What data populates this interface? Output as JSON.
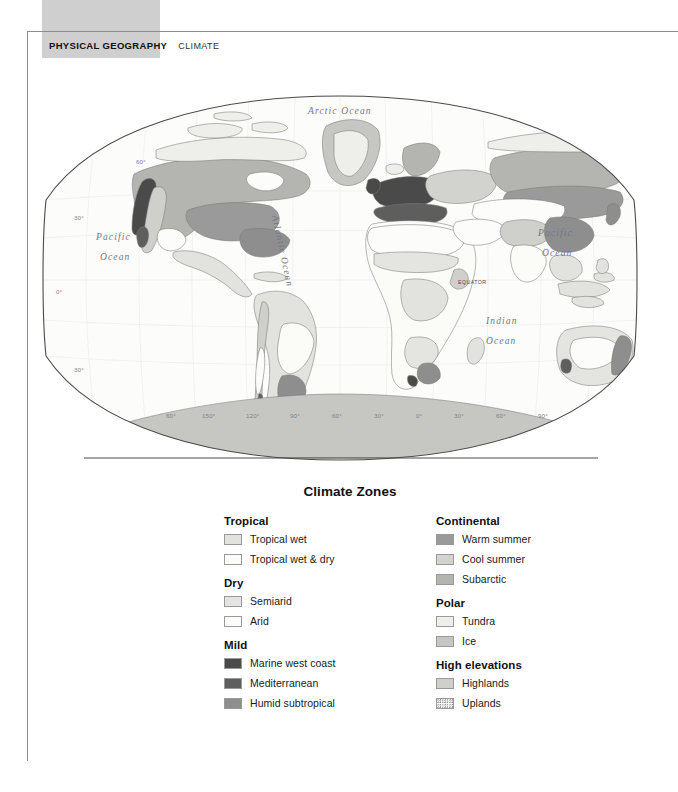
{
  "running_head": {
    "main": "PHYSICAL GEOGRAPHY",
    "sub": "CLIMATE"
  },
  "map": {
    "projection": "Robinson-style oval world map",
    "ocean_labels": [
      {
        "text": "Arctic  Ocean",
        "x": 298,
        "y": 22,
        "size": 9.5,
        "rotate": 0
      },
      {
        "text": "Pacific",
        "x": 70,
        "y": 148,
        "size": 9.5,
        "rotate": 0
      },
      {
        "text": "Ocean",
        "x": 72,
        "y": 168,
        "size": 9.5,
        "rotate": 0
      },
      {
        "text": "Pacific",
        "x": 512,
        "y": 145,
        "size": 9.5,
        "rotate": 0
      },
      {
        "text": "Ocean",
        "x": 514,
        "y": 165,
        "size": 9.5,
        "rotate": 0
      },
      {
        "text": "Indian",
        "x": 456,
        "y": 232,
        "size": 9.5,
        "rotate": 0
      },
      {
        "text": "Ocean",
        "x": 456,
        "y": 252,
        "size": 9.5,
        "rotate": 0
      }
    ],
    "rotated_ocean_label": {
      "text": "Atlantic Ocean",
      "x": 232,
      "y": 140
    },
    "equator_label": "EQUATOR",
    "latitude_labels": [
      "60°",
      "30°",
      "0°",
      "30°",
      "60°"
    ],
    "longitude_labels": [
      "150°",
      "120°",
      "90°",
      "60°",
      "30°",
      "0°",
      "30°",
      "60°",
      "90°",
      "120°",
      "150°"
    ],
    "left_edge_latitudes": [
      {
        "text": "60°",
        "x": 100,
        "y": 73
      },
      {
        "text": "30°",
        "x": 38,
        "y": 129
      },
      {
        "text": "0°",
        "x": 20,
        "y": 204
      },
      {
        "text": "30°",
        "x": 38,
        "y": 281
      }
    ],
    "bottom_longitudes": [
      {
        "text": "60°",
        "x": 134
      },
      {
        "text": "150°",
        "x": 170
      },
      {
        "text": "120°",
        "x": 213
      },
      {
        "text": "90°",
        "x": 257
      },
      {
        "text": "60°",
        "x": 299
      },
      {
        "text": "30°",
        "x": 341
      },
      {
        "text": "0°",
        "x": 383
      },
      {
        "text": "30°",
        "x": 421
      },
      {
        "text": "60°",
        "x": 463
      },
      {
        "text": "90°",
        "x": 505
      },
      {
        "text": "120°",
        "x": 546
      },
      {
        "text": "150°",
        "x": 590
      }
    ]
  },
  "legend": {
    "title": "Climate Zones",
    "columns": [
      {
        "groups": [
          {
            "heading": "Tropical",
            "items": [
              {
                "label": "Tropical wet",
                "color": "#e2e2de",
                "pattern": "solid"
              },
              {
                "label": "Tropical wet & dry",
                "color": "#fbfbf8",
                "pattern": "solid"
              }
            ]
          },
          {
            "heading": "Dry",
            "items": [
              {
                "label": "Semiarid",
                "color": "#e4e4e0",
                "pattern": "solid"
              },
              {
                "label": "Arid",
                "color": "#fcfcfa",
                "pattern": "solid"
              }
            ]
          },
          {
            "heading": "Mild",
            "items": [
              {
                "label": "Marine west coast",
                "color": "#4a4a4a",
                "pattern": "solid"
              },
              {
                "label": "Mediterranean",
                "color": "#5e5e5e",
                "pattern": "solid"
              },
              {
                "label": "Humid subtropical",
                "color": "#8e8e8e",
                "pattern": "solid"
              }
            ]
          }
        ]
      },
      {
        "groups": [
          {
            "heading": "Continental",
            "items": [
              {
                "label": "Warm summer",
                "color": "#9a9a9a",
                "pattern": "solid"
              },
              {
                "label": "Cool summer",
                "color": "#d2d2ce",
                "pattern": "solid"
              },
              {
                "label": "Subarctic",
                "color": "#b4b4b0",
                "pattern": "solid"
              }
            ]
          },
          {
            "heading": "Polar",
            "items": [
              {
                "label": "Tundra",
                "color": "#eeeeea",
                "pattern": "solid"
              },
              {
                "label": "Ice",
                "color": "#c6c6c2",
                "pattern": "solid"
              }
            ]
          },
          {
            "heading": "High elevations",
            "items": [
              {
                "label": "Highlands",
                "color": "#cfcfcb",
                "pattern": "solid"
              },
              {
                "label": "Uplands",
                "color": "#ffffff",
                "pattern": "stipple"
              }
            ]
          }
        ]
      }
    ]
  }
}
